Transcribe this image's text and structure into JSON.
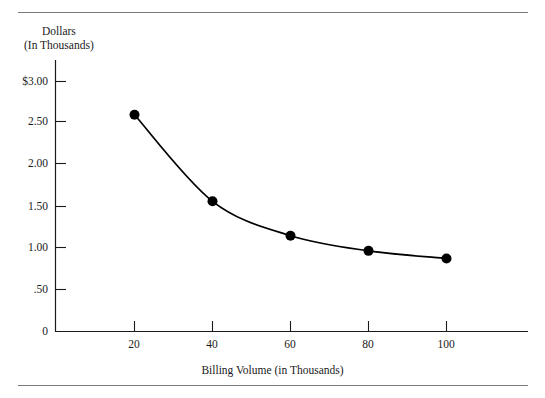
{
  "figure": {
    "rules": [
      "top-rule",
      "bottom-rule"
    ]
  },
  "chart_data": {
    "type": "line",
    "title": "",
    "subtitle": "",
    "xlabel": "Billing Volume (in Thousands)",
    "ylabel_line1": "Dollars",
    "ylabel_line2": "(In Thousands)",
    "x": [
      20,
      40,
      60,
      80,
      100
    ],
    "values": [
      2.58,
      1.55,
      1.14,
      0.96,
      0.87
    ],
    "series": [
      {
        "name": "Cost per unit",
        "values": [
          2.58,
          1.55,
          1.14,
          0.96,
          0.87
        ]
      }
    ],
    "xlim": [
      0,
      121
    ],
    "ylim": [
      0,
      3.35
    ],
    "xticks": [
      20,
      40,
      60,
      80,
      100
    ],
    "xtick_labels": [
      "20",
      "40",
      "60",
      "80",
      "100"
    ],
    "yticks": [
      0,
      0.5,
      1.0,
      1.5,
      2.0,
      2.5,
      3.0
    ],
    "ytick_labels": [
      "0",
      ".50",
      "1.00",
      "1.50",
      "2.00",
      "2.50",
      "$3.00"
    ],
    "grid": false,
    "legend": "none",
    "marker": "filled-circle",
    "marker_color": "#000000",
    "line_color": "#000000",
    "axis_color": "#1a1a1a",
    "background": "#ffffff"
  }
}
